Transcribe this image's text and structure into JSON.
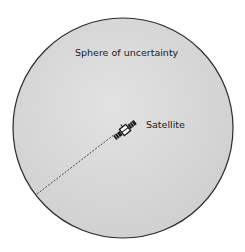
{
  "diagram": {
    "title": "Sphere of uncertainty",
    "labels": {
      "sphere": "Sphere of uncertainty",
      "satellite": "Satellite"
    },
    "sphere": {
      "center_x": 123,
      "center_y": 128,
      "radius": 110,
      "fill_color": "#d6d6d6",
      "stroke_color": "#2a2a2a"
    },
    "satellite": {
      "icon": "satellite-icon",
      "x": 125,
      "y": 130
    },
    "radius_line": {
      "style": "dashed",
      "from": [
        37,
        194
      ],
      "to": [
        115,
        134
      ],
      "color": "#333333"
    }
  }
}
